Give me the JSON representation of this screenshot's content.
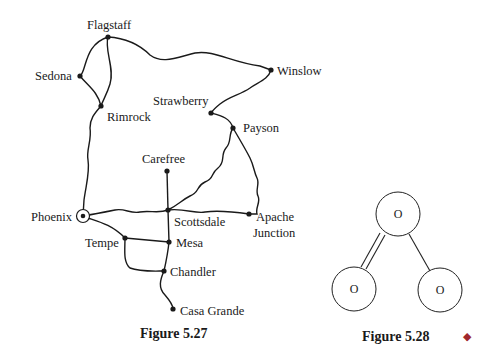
{
  "figure_527": {
    "caption": "Figure 5.27",
    "cities": {
      "flagstaff": "Flagstaff",
      "sedona": "Sedona",
      "rimrock": "Rimrock",
      "winslow": "Winslow",
      "strawberry": "Strawberry",
      "payson": "Payson",
      "carefree": "Carefree",
      "phoenix": "Phoenix",
      "scottsdale": "Scottsdale",
      "apache_1": "Apache",
      "apache_2": "Junction",
      "tempe": "Tempe",
      "mesa": "Mesa",
      "chandler": "Chandler",
      "casa_grande": "Casa Grande"
    }
  },
  "figure_528": {
    "caption": "Figure 5.28",
    "atoms": [
      "O",
      "O",
      "O"
    ],
    "bonds": [
      "double",
      "single"
    ]
  },
  "end_marker": {
    "symbol": "◆",
    "color": "#a0282e"
  }
}
